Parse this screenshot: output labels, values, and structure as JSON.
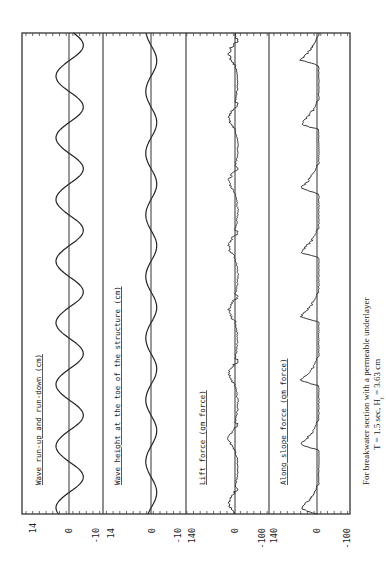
{
  "chart_data": {
    "type": "line",
    "orientation": "rotated-90-ccw",
    "title": "",
    "caption": {
      "line1": "For breakwater section with a permeable underlayer",
      "line2_prefix": "T = 1.5 sec, H",
      "line2_sub": "t",
      "line2_suffix": " = 3.63 cm"
    },
    "xlabel": "time",
    "grid": false,
    "panels": [
      {
        "label": "Wave run-up and run-down (cm)",
        "ylim": [
          -10,
          14
        ],
        "ticks": [
          "14",
          "0",
          "-10"
        ],
        "series": {
          "kind": "sine",
          "amplitude_pos": 5.0,
          "amplitude_neg": -5.5,
          "cycles": 7.8,
          "phase": 0.15
        }
      },
      {
        "label": "Wave height at the toe of the structure (cm)",
        "ylim": [
          -10,
          14
        ],
        "ticks": [
          "14",
          "0",
          "-10"
        ],
        "series": {
          "kind": "sine",
          "amplitude_pos": 2.0,
          "amplitude_neg": -2.2,
          "cycles": 7.8,
          "phase": 0.4
        }
      },
      {
        "label": "Lift force (gm force)",
        "ylim": [
          -100,
          140
        ],
        "ticks": [
          "140",
          "0",
          "-100"
        ],
        "series": {
          "kind": "lift",
          "peak": 25,
          "trough": -18,
          "cycles": 7.5,
          "noise": 5
        }
      },
      {
        "label": "Along slope force (gm force)",
        "ylim": [
          -100,
          140
        ],
        "ticks": [
          "140",
          "0",
          "-100"
        ],
        "series": {
          "kind": "spike",
          "peak": 55,
          "cycles": 7.5,
          "noise": 4
        }
      }
    ]
  }
}
